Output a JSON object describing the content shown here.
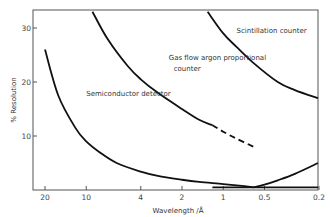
{
  "chart_data": {
    "type": "line",
    "title": "",
    "xlabel": "Wavelength /Å",
    "ylabel": "% Resolution",
    "xscale": "log",
    "xreversed": true,
    "xlim": [
      22,
      0.2
    ],
    "ylim": [
      0,
      33
    ],
    "xticks": [
      20,
      10,
      4,
      2,
      1,
      0.5,
      0.2
    ],
    "xtick_labels": [
      "20",
      "10",
      "4",
      "2",
      "1",
      "0.5",
      "0.2"
    ],
    "yticks": [
      10,
      20,
      30
    ],
    "ytick_labels": [
      "10",
      "20",
      "30"
    ],
    "grid": false,
    "series": [
      {
        "name": "Semiconductor detector",
        "style": "solid",
        "x": [
          20,
          16,
          12,
          10,
          8,
          6,
          4,
          3,
          2,
          1.5,
          1,
          0.7,
          0.6
        ],
        "y": [
          26,
          17.5,
          11.5,
          9,
          7,
          5,
          3.4,
          2.6,
          1.9,
          1.5,
          1.1,
          0.7,
          0.5
        ]
      },
      {
        "name": "Semiconductor detector (rising branch)",
        "style": "thin",
        "x": [
          0.6,
          0.5,
          0.4,
          0.3,
          0.2
        ],
        "y": [
          0.5,
          1.0,
          1.8,
          3.0,
          5.0
        ]
      },
      {
        "name": "Gas flow argon proportional counter",
        "style": "solid",
        "x": [
          9,
          7,
          5,
          4,
          3,
          2,
          1.5,
          1.2
        ],
        "y": [
          33,
          28,
          23,
          20.5,
          18,
          15,
          13,
          12
        ]
      },
      {
        "name": "Gas flow argon proportional counter (extrapolated)",
        "style": "dashed",
        "x": [
          1.2,
          1,
          0.8,
          0.6
        ],
        "y": [
          12,
          10.8,
          9.5,
          8
        ]
      },
      {
        "name": "Scintillation counter",
        "style": "solid",
        "x": [
          1.3,
          1,
          0.8,
          0.6,
          0.4,
          0.3,
          0.2
        ],
        "y": [
          33,
          29,
          26.5,
          23.5,
          20,
          18.5,
          17
        ]
      },
      {
        "name": "Baseline",
        "style": "solid",
        "x": [
          1.2,
          0.2
        ],
        "y": [
          0.5,
          0.5
        ]
      }
    ],
    "annotations": [
      {
        "text": "Scintillation counter",
        "x": 0.8,
        "y": 29
      },
      {
        "text": "Gas flow argon proportional",
        "x": 2.5,
        "y": 24
      },
      {
        "text": "counter",
        "x": 2.3,
        "y": 22
      },
      {
        "text": "Semiconductor detector",
        "x": 10,
        "y": 17.5
      }
    ]
  }
}
